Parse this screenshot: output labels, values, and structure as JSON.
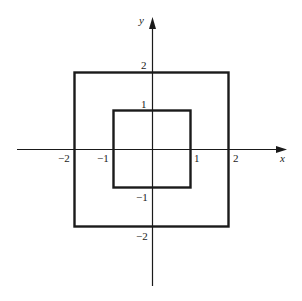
{
  "diagram": {
    "type": "coordinate-plane",
    "axes": {
      "x_label": "x",
      "y_label": "y"
    },
    "x_ticks": [
      {
        "value": -2,
        "label": "−2"
      },
      {
        "value": -1,
        "label": "−1"
      },
      {
        "value": 1,
        "label": "1"
      },
      {
        "value": 2,
        "label": "2"
      }
    ],
    "y_ticks": [
      {
        "value": 2,
        "label": "2"
      },
      {
        "value": 1,
        "label": "1"
      },
      {
        "value": -1,
        "label": "−1"
      },
      {
        "value": -2,
        "label": "−2"
      }
    ],
    "shapes": [
      {
        "name": "outer-square",
        "x_min": -2,
        "x_max": 2,
        "y_min": -2,
        "y_max": 2
      },
      {
        "name": "inner-square",
        "x_min": -1,
        "x_max": 1,
        "y_min": -1,
        "y_max": 1
      }
    ],
    "colors": {
      "line": "#1a1a1a",
      "background": "#ffffff"
    }
  }
}
